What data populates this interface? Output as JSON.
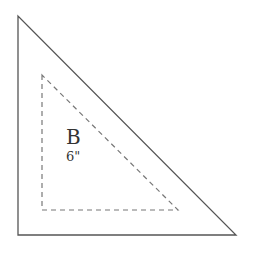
{
  "diagram": {
    "outer_triangle": {
      "points": "18,16 18,235 236,235",
      "stroke": "#555555",
      "style": "solid"
    },
    "inner_triangle": {
      "points": "42,75 42,210 178,210",
      "stroke": "#777777",
      "style": "dashed"
    },
    "label": "B",
    "dimension": "6\""
  }
}
